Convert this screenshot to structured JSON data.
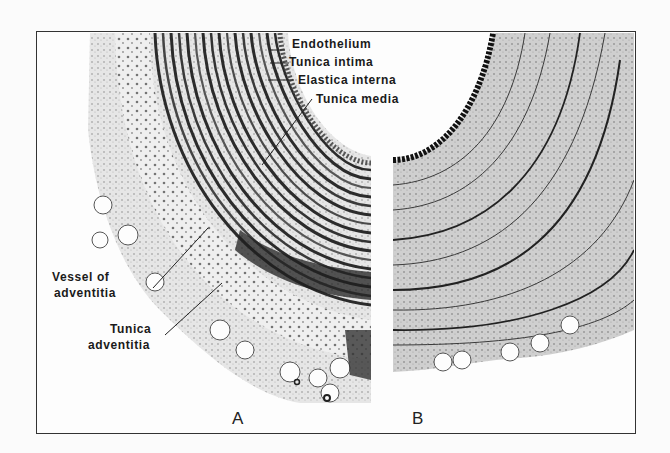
{
  "figure": {
    "panels": [
      {
        "id": "A",
        "letter": "A",
        "description": "Cross-section of artery wall, routine stain"
      },
      {
        "id": "B",
        "letter": "B",
        "description": "Cross-section of artery wall, elastic stain"
      }
    ],
    "labels": {
      "endothelium": "Endothelium",
      "tunica_intima": "Tunica intima",
      "elastica_interna": "Elastica interna",
      "tunica_media": "Tunica media",
      "vessel_of_adventitia_line1": "Vessel of",
      "vessel_of_adventitia_line2": "adventitia",
      "tunica_adventitia_line1": "Tunica",
      "tunica_adventitia_line2": "adventitia"
    },
    "colors": {
      "ink": "#1a1a1a",
      "tissue_dark": "#2a2a2a",
      "tissue_mid": "#7a7a7a",
      "tissue_light": "#c8c8c8",
      "background": "#fdfdfd"
    }
  }
}
